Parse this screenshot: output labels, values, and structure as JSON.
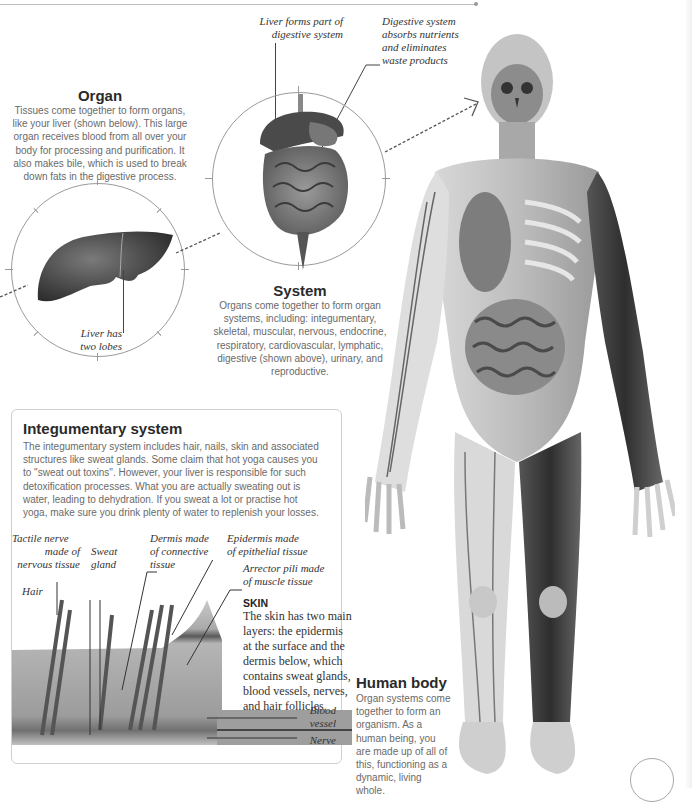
{
  "page": {
    "background": "#ffffff",
    "accent_line_color": "#bdbdbd"
  },
  "organ": {
    "title": "Organ",
    "body": "Tissues come together to form organs, like your liver (shown below). This large organ receives blood from all over your body for processing and purification. It also makes bile, which is used to break down fats in the digestive process.",
    "liver_label_line1": "Liver has",
    "liver_label_line2": "two lobes",
    "image_alt": "liver-illustration"
  },
  "system": {
    "title": "System",
    "body": "Organs come together to form organ systems, including: integumentary, skeletal, muscular, nervous, endocrine, respiratory, cardiovascular, lymphatic, digestive (shown above), urinary, and reproductive.",
    "label_liver_line1": "Liver forms part of",
    "label_liver_line2": "digestive system",
    "label_digestive_line1": "Digestive system",
    "label_digestive_line2": "absorbs nutrients",
    "label_digestive_line3": "and eliminates",
    "label_digestive_line4": "waste products",
    "image_alt": "digestive-system-illustration"
  },
  "integumentary": {
    "title": "Integumentary system",
    "body": "The integumentary system includes hair, nails, skin and associated structures like sweat glands. Some claim that hot yoga causes you to \"sweat out toxins\". However, your liver is responsible for such detoxification processes. What you are actually sweating out is water, leading to dehydration. If you sweat a lot or practise hot yoga, make sure you drink plenty of water to replenish your losses.",
    "labels": {
      "tactile_line1": "Tactile nerve",
      "tactile_line2": "made of",
      "tactile_line3": "nervous tissue",
      "sweat_line1": "Sweat",
      "sweat_line2": "gland",
      "dermis_line1": "Dermis made",
      "dermis_line2": "of connective",
      "dermis_line3": "tissue",
      "epidermis_line1": "Epidermis made",
      "epidermis_line2": "of epithelial tissue",
      "arrector_line1": "Arrector pili made",
      "arrector_line2": "of muscle tissue",
      "hair": "Hair",
      "blood_line1": "Blood",
      "blood_line2": "vessel",
      "nerve": "Nerve"
    },
    "skin": {
      "title": "SKIN",
      "body": "The skin has two main layers: the epidermis at the surface and the dermis below, which contains sweat glands, blood vessels, nerves, and hair follicles."
    },
    "image_alt": "skin-cross-section-illustration"
  },
  "human_body": {
    "title": "Human body",
    "body": "Organ systems come together to form an organism. As a human being, you are made up of all of this, functioning as a dynamic,  living whole.",
    "image_alt": "human-body-anatomy-illustration"
  }
}
